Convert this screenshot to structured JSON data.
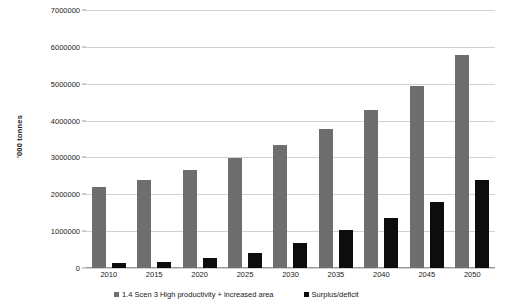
{
  "chart_data": {
    "type": "bar",
    "title": "",
    "subtitle": "",
    "xlabel": "",
    "ylabel": "'000 tonnes",
    "ylim": [
      0,
      7000000
    ],
    "ytick_step": 1000000,
    "yticks": [
      0,
      1000000,
      2000000,
      3000000,
      4000000,
      5000000,
      6000000,
      7000000
    ],
    "ytick_labels": [
      "0",
      "1000000",
      "2000000",
      "3000000",
      "4000000",
      "5000000",
      "6000000",
      "7000000"
    ],
    "grid": true,
    "grid_axis": "y",
    "legend_position": "bottom",
    "categories": [
      "2010",
      "2015",
      "2020",
      "2025",
      "2030",
      "2035",
      "2040",
      "2045",
      "2050"
    ],
    "series": [
      {
        "name": "1.4 Scen 3 High productivity + increased area",
        "color": "#6e6e6e",
        "values": [
          2210000,
          2390000,
          2670000,
          2980000,
          3330000,
          3770000,
          4300000,
          4940000,
          5770000
        ]
      },
      {
        "name": "Surplus/deficit",
        "color": "#0d0d0d",
        "values": [
          130000,
          160000,
          270000,
          420000,
          690000,
          1020000,
          1360000,
          1800000,
          2400000
        ]
      }
    ]
  },
  "legend": {
    "items": [
      {
        "label": "1.4 Scen 3 High productivity + increased area"
      },
      {
        "label": "Surplus/deficit"
      }
    ]
  }
}
